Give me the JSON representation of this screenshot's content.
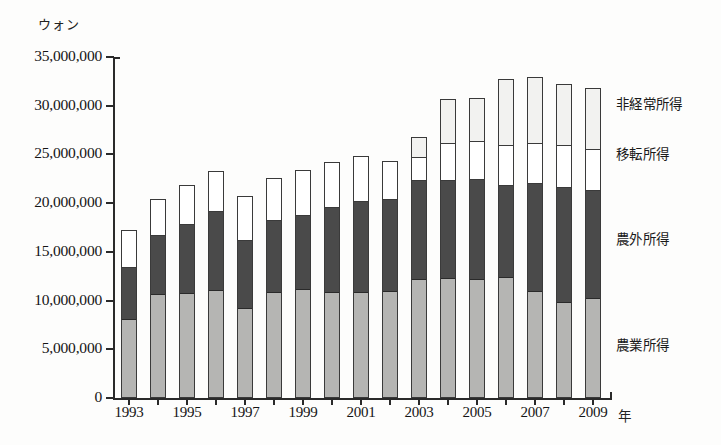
{
  "caption": {
    "top_fragment": "",
    "bottom_fragment": ""
  },
  "axis": {
    "y_unit": "ウォン",
    "x_unit": "年"
  },
  "legend": [
    {
      "label": "非経常所得",
      "color": "#f2f2f0",
      "top": 93
    },
    {
      "label": "移転所得",
      "color": "#ffffff",
      "top": 143
    },
    {
      "label": "農外所得",
      "color": "#4a4a4a",
      "top": 228
    },
    {
      "label": "農業所得",
      "color": "#b5b5b3",
      "top": 334
    }
  ],
  "chart_data": {
    "type": "bar",
    "stacked": true,
    "title": "",
    "xlabel": "年",
    "ylabel": "ウォン",
    "ylim": [
      0,
      35000000
    ],
    "ytick_step": 5000000,
    "ytick_labels": [
      "35,000,000",
      "30,000,000",
      "25,000,000",
      "20,000,000",
      "15,000,000",
      "10,000,000",
      "5,000,000",
      "0"
    ],
    "ytick_values": [
      35000000,
      30000000,
      25000000,
      20000000,
      15000000,
      10000000,
      5000000,
      0
    ],
    "grid": false,
    "legend_position": "right",
    "categories": [
      1993,
      1994,
      1995,
      1996,
      1997,
      1998,
      1999,
      2000,
      2001,
      2002,
      2003,
      2004,
      2005,
      2006,
      2007,
      2008,
      2009
    ],
    "xtick_labels": [
      "1993",
      "",
      "1995",
      "",
      "1997",
      "",
      "1999",
      "",
      "2001",
      "",
      "2003",
      "",
      "2005",
      "",
      "2007",
      "",
      "2009"
    ],
    "series": [
      {
        "name": "農業所得",
        "color": "#b5b5b3",
        "values": [
          8000000,
          10600000,
          10700000,
          11000000,
          9100000,
          10800000,
          11100000,
          10800000,
          10800000,
          10900000,
          12100000,
          12200000,
          12100000,
          12300000,
          10800000,
          9700000,
          10100000
        ]
      },
      {
        "name": "農外所得",
        "color": "#4a4a4a",
        "values": [
          5400000,
          6100000,
          7100000,
          8200000,
          7100000,
          7400000,
          7600000,
          8800000,
          9400000,
          9500000,
          10200000,
          10100000,
          10300000,
          9500000,
          11200000,
          11900000,
          11200000
        ]
      },
      {
        "name": "移転所得",
        "color": "#ffffff",
        "values": [
          3800000,
          3700000,
          4100000,
          4100000,
          4500000,
          4400000,
          4700000,
          4600000,
          4600000,
          3900000,
          2400000,
          3800000,
          4000000,
          4100000,
          4100000,
          4300000,
          4200000
        ]
      },
      {
        "name": "非経常所得",
        "color": "#f2f2f0",
        "values": [
          0,
          0,
          0,
          0,
          0,
          0,
          0,
          0,
          0,
          0,
          2100000,
          4600000,
          4400000,
          6800000,
          6900000,
          6300000,
          6300000
        ]
      }
    ],
    "totals": [
      17200000,
      20400000,
      21900000,
      23300000,
      20700000,
      22600000,
      23400000,
      24200000,
      24800000,
      24300000,
      26800000,
      30700000,
      30800000,
      32700000,
      33000000,
      32200000,
      31800000
    ]
  }
}
